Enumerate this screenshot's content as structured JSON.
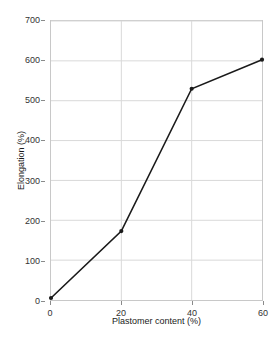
{
  "chart_data": {
    "type": "line",
    "title": "",
    "xlabel": "Plastomer content (%)",
    "ylabel": "Elongation (%)",
    "xlim": [
      0,
      60
    ],
    "ylim": [
      0,
      700
    ],
    "xticks": [
      0,
      20,
      40,
      60
    ],
    "yticks": [
      0,
      100,
      200,
      300,
      400,
      500,
      600,
      700
    ],
    "xtick_labels": [
      "0",
      "20",
      "40",
      "60"
    ],
    "ytick_labels": [
      "0",
      "100",
      "200",
      "300",
      "400",
      "500",
      "600",
      "700"
    ],
    "grid": true,
    "legend": false,
    "legend_position": "none",
    "marker": "filled-dot",
    "line_color": "#1a1a1a",
    "grid_color": "#d9d9d9",
    "border_color": "#c8c8c8",
    "x": [
      0,
      20,
      40,
      60
    ],
    "values": [
      5,
      173,
      530,
      603
    ],
    "series": [
      {
        "name": "Elongation",
        "x": [
          0,
          20,
          40,
          60
        ],
        "values": [
          5,
          173,
          530,
          603
        ]
      }
    ]
  }
}
